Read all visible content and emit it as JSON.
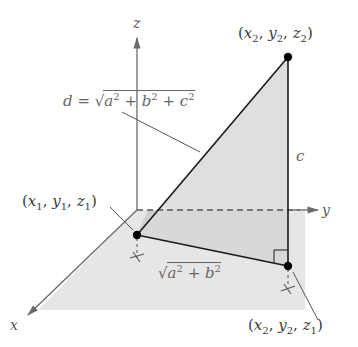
{
  "diagram": {
    "axes": {
      "x_label": "x",
      "y_label": "y",
      "z_label": "z"
    },
    "points": {
      "p1": {
        "label": "(x1, y1, z1)",
        "x": "x",
        "xs": "1",
        "y": "y",
        "ys": "1",
        "z": "z",
        "zs": "1"
      },
      "p2": {
        "label": "(x2, y2, z2)",
        "x": "x",
        "xs": "2",
        "y": "y",
        "ys": "2",
        "z": "z",
        "zs": "2"
      },
      "p3": {
        "label": "(x2, y2, z1)",
        "x": "x",
        "xs": "2",
        "y": "y",
        "ys": "2",
        "z": "z",
        "zs": "1"
      }
    },
    "labels": {
      "distance_formula": "d = √(a² + b² + c²)",
      "d": "d",
      "eq": " = ",
      "a": "a",
      "b": "b",
      "c": "c",
      "plus": " + ",
      "two": "2",
      "base_formula": "√(a² + b²)",
      "side_c": "c"
    },
    "colors": {
      "plane_fill": "#e6e6e6",
      "triangle_fill": "#d9d9d9",
      "shadow_fill": "#cfcfcf",
      "line": "#1a1a1a",
      "axis": "#6a6a6a"
    }
  }
}
